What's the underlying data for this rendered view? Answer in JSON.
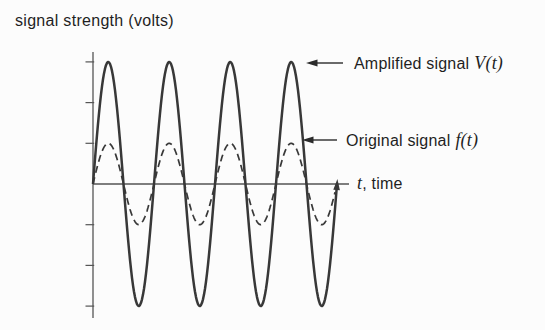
{
  "figure": {
    "y_axis_title": "signal strength (volts)",
    "x_axis_label": {
      "math": "t",
      "rest": ", time"
    },
    "annotations": {
      "amplified": {
        "label": "Amplified signal",
        "math": "V(t)"
      },
      "original": {
        "label": "Original signal",
        "math": "f(t)"
      }
    }
  },
  "chart_data": {
    "type": "line",
    "ylabel": "signal strength (volts)",
    "xlabel": "t, time",
    "x_range_cycles": [
      0,
      4
    ],
    "ylim": [
      -3.5,
      3.5
    ],
    "y_ticks": [
      3,
      2,
      1,
      -1,
      -2,
      -3
    ],
    "x_tick_labels": [],
    "grid": false,
    "legend_position": "inline arrow annotations",
    "series": [
      {
        "name": "Amplified signal V(t)",
        "waveform": "sine",
        "amplitude": 3,
        "cycles": 4,
        "phase_deg": 0,
        "line_style": "solid",
        "end_marker": "arrowhead-up-at-final-zero-crossing"
      },
      {
        "name": "Original signal f(t)",
        "waveform": "sine",
        "amplitude": 1,
        "cycles": 4,
        "phase_deg": 0,
        "line_style": "dashed",
        "end_marker": "none"
      }
    ],
    "annotation_arrows": [
      {
        "text": "Amplified signal V(t)",
        "points_to": "4th peak of V(t)"
      },
      {
        "text": "Original signal f(t)",
        "points_to": "4th peak of f(t)"
      }
    ]
  },
  "colors": {
    "curve_ink": "#383838",
    "axis_ink": "#555555",
    "text_ink": "#1f1f1f",
    "background": "#fcfcfc"
  }
}
